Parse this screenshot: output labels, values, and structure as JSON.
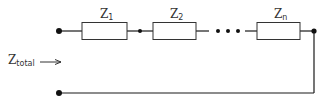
{
  "diagram": {
    "total_label": {
      "main": "Z",
      "sub": "total"
    },
    "impedances": [
      {
        "main": "Z",
        "sub": "1"
      },
      {
        "main": "Z",
        "sub": "2"
      },
      {
        "main": "Z",
        "sub": "n"
      }
    ],
    "ellipsis": "•••",
    "colors": {
      "wire": "#1a1a1a",
      "box": "#333333",
      "text": "#333333"
    }
  }
}
